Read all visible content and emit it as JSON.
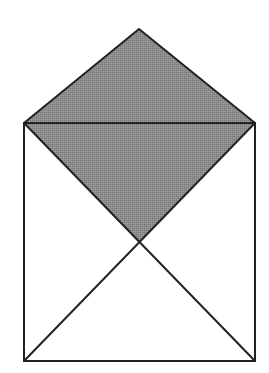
{
  "figure": {
    "canvas": {
      "width": 269,
      "height": 373
    },
    "colors": {
      "background": "#ffffff",
      "stroke": "#222222",
      "shade_fill": "#8c8c8c"
    },
    "stroke_width": 2,
    "points": {
      "apex": [
        139,
        29
      ],
      "top_left": [
        24,
        123
      ],
      "top_right": [
        255,
        123
      ],
      "center": [
        139,
        243
      ],
      "bottom_left": [
        24,
        361
      ],
      "bottom_right": [
        255,
        361
      ]
    },
    "shaded_region": "apex-top_right-center-top_left"
  }
}
